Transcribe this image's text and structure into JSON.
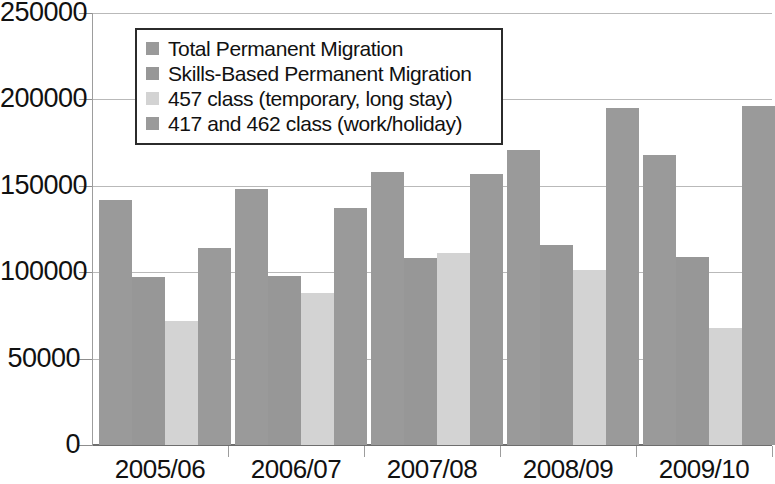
{
  "chart_data": {
    "type": "bar",
    "title": "",
    "subtitle": "",
    "xlabel": "",
    "ylabel": "",
    "grid": true,
    "legend_position": "top-left-inside",
    "categories": [
      "2005/06",
      "2006/07",
      "2007/08",
      "2008/09",
      "2009/10"
    ],
    "ylim": [
      0,
      250000
    ],
    "ytick_values": [
      0,
      50000,
      100000,
      150000,
      200000,
      250000
    ],
    "ytick_labels": [
      "0",
      "50000",
      "100000",
      "150000",
      "200000",
      "250000"
    ],
    "series": [
      {
        "name": "Total Permanent Migration",
        "color": "#9a9a9a",
        "values": [
          142000,
          148000,
          158000,
          171000,
          168000
        ]
      },
      {
        "name": "Skills-Based Permanent Migration",
        "color": "#979797",
        "values": [
          97000,
          98000,
          108000,
          116000,
          109000
        ]
      },
      {
        "name": "457 class (temporary, long stay)",
        "color": "#d3d3d3",
        "values": [
          72000,
          88000,
          111000,
          101000,
          68000
        ]
      },
      {
        "name": "417 and 462 class (work/holiday)",
        "color": "#9a9a9a",
        "values": [
          114000,
          137000,
          157000,
          195000,
          196000
        ]
      }
    ]
  },
  "colors": {
    "gridline": "#b9b9b9",
    "axis": "#9d9d9d",
    "baseline": "#6e6e6e",
    "text": "#111111",
    "legend_border": "#2b2b2b",
    "background": "#ffffff"
  }
}
